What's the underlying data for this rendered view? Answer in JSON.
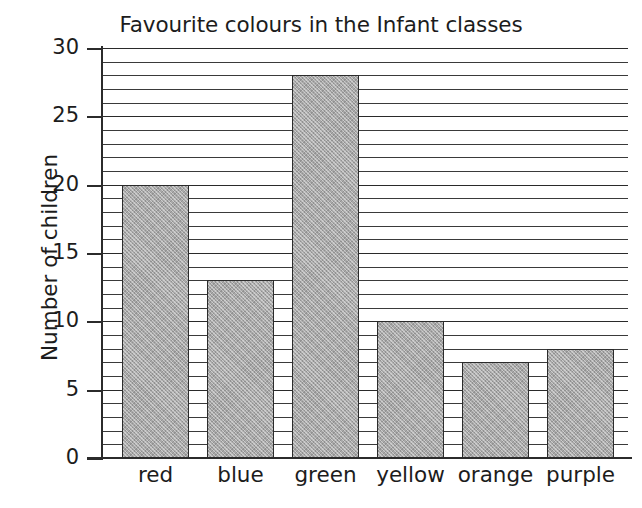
{
  "chart_data": {
    "type": "bar",
    "title": "Favourite colours in the Infant classes",
    "xlabel": "",
    "ylabel": "Number of children",
    "categories": [
      "red",
      "blue",
      "green",
      "yellow",
      "orange",
      "purple"
    ],
    "values": [
      20,
      13,
      28,
      10,
      7,
      8
    ],
    "ylim": [
      0,
      30
    ],
    "y_major_ticks": [
      0,
      5,
      10,
      15,
      20,
      25,
      30
    ],
    "y_tick_labels": [
      "0",
      "5",
      "10",
      "15",
      "20",
      "25",
      "30"
    ],
    "y_minor_tick_step": 1,
    "grid": true,
    "grid_axis": "y",
    "legend": false,
    "bar_fill": "#a9a9a9",
    "bar_outline": "#2b2b2b",
    "axis_color": "#2b2b2b",
    "background": "#ffffff"
  }
}
